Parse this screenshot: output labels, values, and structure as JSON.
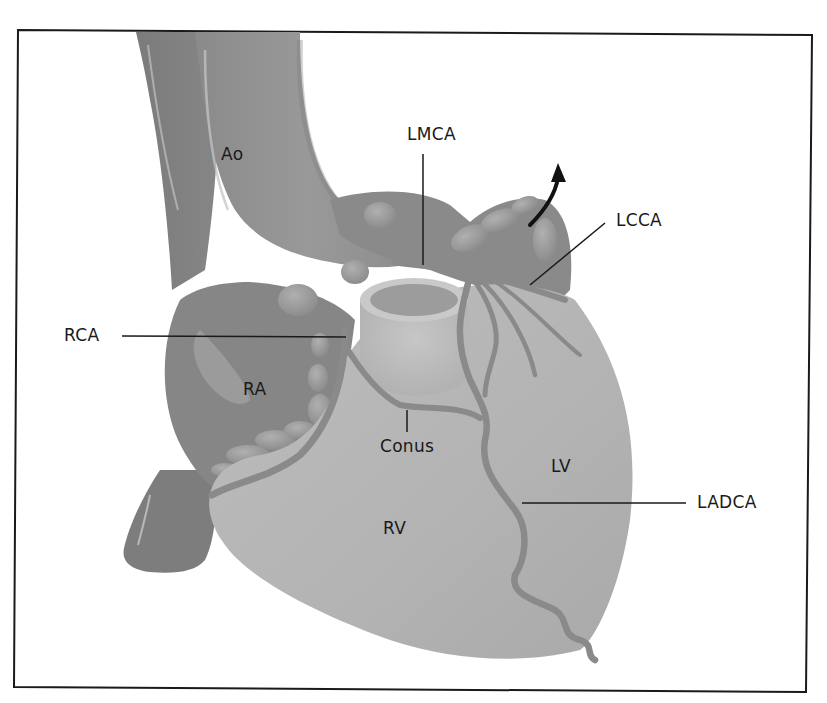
{
  "figure": {
    "type": "anatomical-illustration",
    "colors": {
      "background": "#ffffff",
      "frame": "#1a1a1a",
      "vessel_dark": "#7a7a7a",
      "vessel_mid": "#8e8e8e",
      "aorta": "#959595",
      "ventricle": "#b8b8b8",
      "atrium": "#888888",
      "artery": "#8a8a8a",
      "highlight": "#d8d8d8",
      "leader_line": "#1a1a1a"
    }
  },
  "labels": {
    "ao": "Ao",
    "lmca": "LMCA",
    "lcca": "LCCA",
    "rca": "RCA",
    "ra": "RA",
    "conus": "Conus",
    "lv": "LV",
    "rv": "RV",
    "ladca": "LADCA"
  },
  "annotations": {
    "arrow": "curved-arrow-upward"
  }
}
